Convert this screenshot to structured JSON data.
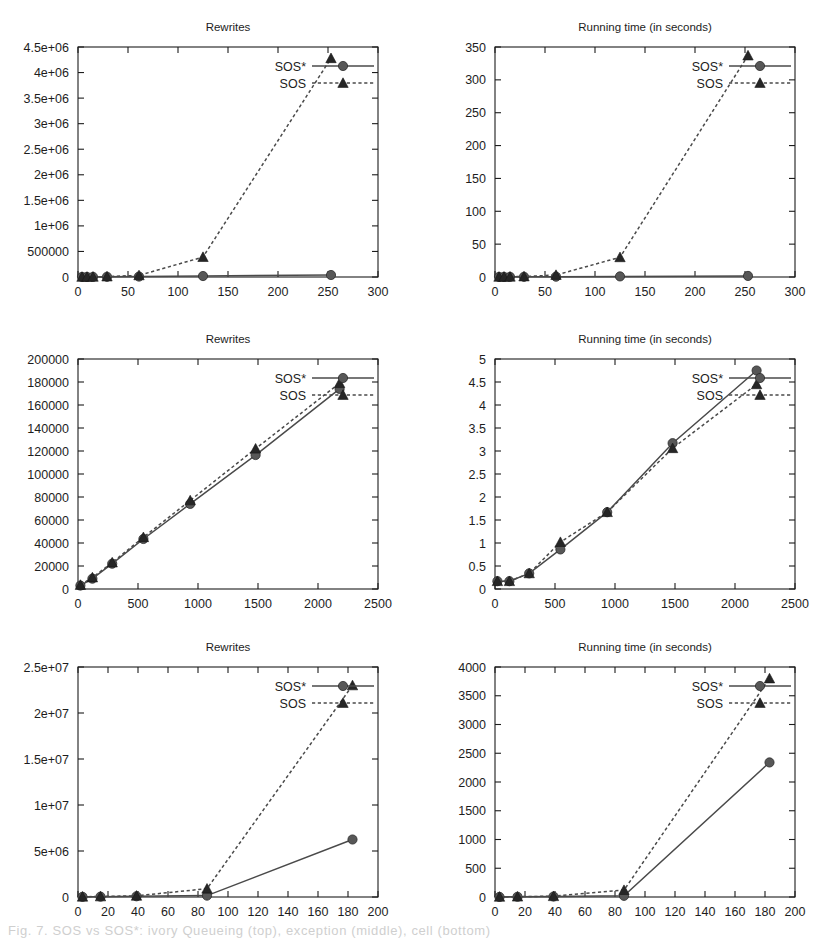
{
  "figure": {
    "panel_count": 6,
    "legend_entries": [
      "SOS*",
      "SOS"
    ],
    "caption_fragment": "Fig. 7. SOS vs SOS*: ivory  Queueing (top), exception (middle), cell  (bottom)"
  },
  "chart_data": [
    {
      "id": "panel-top-left",
      "type": "line",
      "title": "Rewrites",
      "xlabel": "",
      "ylabel": "",
      "xlim": [
        0,
        300
      ],
      "ylim": [
        0,
        4500000
      ],
      "xticks": [
        0,
        50,
        100,
        150,
        200,
        250,
        300
      ],
      "xticklabels": [
        "0",
        "50",
        "100",
        "150",
        "200",
        "250",
        "300"
      ],
      "yticks": [
        0,
        500000,
        1000000,
        1500000,
        2000000,
        2500000,
        3000000,
        3500000,
        4000000,
        4500000
      ],
      "yticklabels": [
        "0",
        "500000",
        "1e+06",
        "1.5e+06",
        "2e+06",
        "2.5e+06",
        "3e+06",
        "3.5e+06",
        "4e+06",
        "4.5e+06"
      ],
      "grid": false,
      "legend_position": "top-right",
      "series": [
        {
          "name": "SOS*",
          "marker": "circle",
          "dashed": false,
          "x": [
            4,
            9,
            15,
            29,
            61,
            125,
            253
          ],
          "y": [
            900,
            1400,
            2100,
            4200,
            9000,
            19000,
            39000
          ]
        },
        {
          "name": "SOS",
          "marker": "triangle",
          "dashed": true,
          "x": [
            4,
            9,
            15,
            29,
            61,
            125,
            253
          ],
          "y": [
            1200,
            2000,
            3500,
            9000,
            32000,
            390000,
            4280000
          ]
        }
      ]
    },
    {
      "id": "panel-top-right",
      "type": "line",
      "title": "Running time (in seconds)",
      "xlabel": "",
      "ylabel": "",
      "xlim": [
        0,
        300
      ],
      "ylim": [
        0,
        350
      ],
      "xticks": [
        0,
        50,
        100,
        150,
        200,
        250,
        300
      ],
      "xticklabels": [
        "0",
        "50",
        "100",
        "150",
        "200",
        "250",
        "300"
      ],
      "yticks": [
        0,
        50,
        100,
        150,
        200,
        250,
        300,
        350
      ],
      "yticklabels": [
        "0",
        "50",
        "100",
        "150",
        "200",
        "250",
        "300",
        "350"
      ],
      "grid": false,
      "legend_position": "top-right",
      "series": [
        {
          "name": "SOS*",
          "marker": "circle",
          "dashed": false,
          "x": [
            4,
            9,
            15,
            29,
            61,
            125,
            253
          ],
          "y": [
            0.1,
            0.15,
            0.2,
            0.3,
            0.5,
            0.9,
            1.6
          ]
        },
        {
          "name": "SOS",
          "marker": "triangle",
          "dashed": true,
          "x": [
            4,
            9,
            15,
            29,
            61,
            125,
            253
          ],
          "y": [
            0.2,
            0.3,
            0.4,
            0.8,
            3.0,
            30.0,
            337.0
          ]
        }
      ]
    },
    {
      "id": "panel-middle-left",
      "type": "line",
      "title": "Rewrites",
      "xlabel": "",
      "ylabel": "",
      "xlim": [
        0,
        2500
      ],
      "ylim": [
        0,
        200000
      ],
      "xticks": [
        0,
        500,
        1000,
        1500,
        2000,
        2500
      ],
      "xticklabels": [
        "0",
        "500",
        "1000",
        "1500",
        "2000",
        "2500"
      ],
      "yticks": [
        0,
        20000,
        40000,
        60000,
        80000,
        100000,
        120000,
        140000,
        160000,
        180000,
        200000
      ],
      "yticklabels": [
        "0",
        "20000",
        "40000",
        "60000",
        "80000",
        "100000",
        "120000",
        "140000",
        "160000",
        "180000",
        "200000"
      ],
      "grid": false,
      "legend_position": "top-right",
      "series": [
        {
          "name": "SOS*",
          "marker": "circle",
          "dashed": false,
          "x": [
            20,
            120,
            285,
            545,
            935,
            1480,
            2180
          ],
          "y": [
            3000,
            9000,
            22000,
            43500,
            74000,
            116500,
            174000
          ]
        },
        {
          "name": "SOS",
          "marker": "triangle",
          "dashed": true,
          "x": [
            20,
            120,
            285,
            545,
            935,
            1480,
            2180
          ],
          "y": [
            3500,
            10000,
            23000,
            45000,
            77000,
            122000,
            179000
          ]
        }
      ]
    },
    {
      "id": "panel-middle-right",
      "type": "line",
      "title": "Running time (in seconds)",
      "xlabel": "",
      "ylabel": "",
      "xlim": [
        0,
        2500
      ],
      "ylim": [
        0,
        5
      ],
      "xticks": [
        0,
        500,
        1000,
        1500,
        2000,
        2500
      ],
      "xticklabels": [
        "0",
        "500",
        "1000",
        "1500",
        "2000",
        "2500"
      ],
      "yticks": [
        0,
        0.5,
        1,
        1.5,
        2,
        2.5,
        3,
        3.5,
        4,
        4.5,
        5
      ],
      "yticklabels": [
        "0",
        "0.5",
        "1",
        "1.5",
        "2",
        "2.5",
        "3",
        "3.5",
        "4",
        "4.5",
        "5"
      ],
      "grid": false,
      "legend_position": "top-right",
      "series": [
        {
          "name": "SOS*",
          "marker": "circle",
          "dashed": false,
          "x": [
            20,
            120,
            285,
            545,
            935,
            1480,
            2180
          ],
          "y": [
            0.17,
            0.17,
            0.34,
            0.86,
            1.67,
            3.17,
            4.75
          ]
        },
        {
          "name": "SOS",
          "marker": "triangle",
          "dashed": true,
          "x": [
            20,
            120,
            285,
            545,
            935,
            1480,
            2180
          ],
          "y": [
            0.17,
            0.17,
            0.34,
            1.02,
            1.67,
            3.06,
            4.45
          ]
        }
      ]
    },
    {
      "id": "panel-bottom-left",
      "type": "line",
      "title": "Rewrites",
      "xlabel": "",
      "ylabel": "",
      "xlim": [
        0,
        200
      ],
      "ylim": [
        0,
        25000000
      ],
      "xticks": [
        0,
        20,
        40,
        60,
        80,
        100,
        120,
        140,
        160,
        180,
        200
      ],
      "xticklabels": [
        "0",
        "20",
        "40",
        "60",
        "80",
        "100",
        "120",
        "140",
        "160",
        "180",
        "200"
      ],
      "yticks": [
        0,
        5000000,
        10000000,
        15000000,
        20000000,
        25000000
      ],
      "yticklabels": [
        "0",
        "5e+06",
        "1e+07",
        "1.5e+07",
        "2e+07",
        "2.5e+07"
      ],
      "grid": false,
      "legend_position": "top-right",
      "series": [
        {
          "name": "SOS*",
          "marker": "circle",
          "dashed": false,
          "x": [
            3,
            15,
            39,
            86,
            183
          ],
          "y": [
            20000,
            40000,
            80000,
            150000,
            6250000
          ]
        },
        {
          "name": "SOS",
          "marker": "triangle",
          "dashed": true,
          "x": [
            3,
            15,
            39,
            86,
            183
          ],
          "y": [
            30000,
            60000,
            130000,
            900000,
            23000000
          ]
        }
      ]
    },
    {
      "id": "panel-bottom-right",
      "type": "line",
      "title": "Running time (in seconds)",
      "xlabel": "",
      "ylabel": "",
      "xlim": [
        0,
        200
      ],
      "ylim": [
        0,
        4000
      ],
      "xticks": [
        0,
        20,
        40,
        60,
        80,
        100,
        120,
        140,
        160,
        180,
        200
      ],
      "xticklabels": [
        "0",
        "20",
        "40",
        "60",
        "80",
        "100",
        "120",
        "140",
        "160",
        "180",
        "200"
      ],
      "yticks": [
        0,
        500,
        1000,
        1500,
        2000,
        2500,
        3000,
        3500,
        4000
      ],
      "yticklabels": [
        "0",
        "500",
        "1000",
        "1500",
        "2000",
        "2500",
        "3000",
        "3500",
        "4000"
      ],
      "grid": false,
      "legend_position": "top-right",
      "series": [
        {
          "name": "SOS*",
          "marker": "circle",
          "dashed": false,
          "x": [
            3,
            15,
            39,
            86,
            183
          ],
          "y": [
            2,
            4,
            8,
            20,
            2340
          ]
        },
        {
          "name": "SOS",
          "marker": "triangle",
          "dashed": true,
          "x": [
            3,
            15,
            39,
            86,
            183
          ],
          "y": [
            3,
            6,
            14,
            120,
            3800
          ]
        }
      ]
    }
  ]
}
